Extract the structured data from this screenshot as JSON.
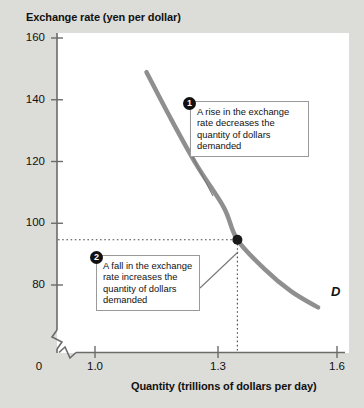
{
  "figure": {
    "background_color": "#dcdcd8",
    "plot_background_color": "#ffffff"
  },
  "chart_data": {
    "type": "line",
    "title": "",
    "xlabel": "Quantity (trillions of dollars per day)",
    "ylabel": "Exchange rate (yen per dollar)",
    "xlim": [
      0.85,
      1.62
    ],
    "ylim": [
      72,
      162
    ],
    "xticks": [
      "0",
      "1.0",
      "1.3",
      "1.6"
    ],
    "xtick_values": [
      0,
      1.0,
      1.3,
      1.6
    ],
    "yticks": [
      "160",
      "140",
      "120",
      "100",
      "80"
    ],
    "ytick_values": [
      160,
      140,
      120,
      100,
      80
    ],
    "grid": false,
    "legend": "none",
    "axis_break_x": true,
    "axis_break_y": true,
    "series": [
      {
        "name": "D",
        "label": "D",
        "color": "#8f8f8f",
        "linewidth": 4.5,
        "points": [
          {
            "x": 1.03,
            "y": 152
          },
          {
            "x": 1.1,
            "y": 138
          },
          {
            "x": 1.18,
            "y": 123
          },
          {
            "x": 1.26,
            "y": 110
          },
          {
            "x": 1.3,
            "y": 100
          },
          {
            "x": 1.38,
            "y": 91
          },
          {
            "x": 1.46,
            "y": 84
          },
          {
            "x": 1.54,
            "y": 79
          }
        ]
      }
    ],
    "markers": [
      {
        "name": "equilibrium-point",
        "x": 1.3,
        "y": 100,
        "color": "#1a1a1a",
        "radius": 5,
        "dropline_x": true,
        "dropline_y": true,
        "dropline_style": "dotted"
      }
    ],
    "annotations": [
      {
        "number": "1",
        "text": "A rise in the exchange rate decreases the quantity of dollars demanded",
        "points_to": {
          "x": 1.22,
          "y": 115
        }
      },
      {
        "number": "2",
        "text": "A fall in the exchange rate increases the quantity of dollars demanded",
        "points_to": {
          "x": 1.38,
          "y": 91
        }
      }
    ]
  },
  "labels": {
    "y_axis_title": "Exchange rate (yen per dollar)",
    "x_axis_title": "Quantity (trillions of dollars per day)",
    "y_160": "160",
    "y_140": "140",
    "y_120": "120",
    "y_100": "100",
    "y_80": "80",
    "x_0": "0",
    "x_10": "1.0",
    "x_13": "1.3",
    "x_16": "1.6",
    "curve": "D",
    "badge_1": "1",
    "badge_2": "2",
    "callout_1": "A rise in the exchange rate decreases the quantity of dollars demanded",
    "callout_2": "A fall in the exchange rate increases the quantity of dollars demanded"
  },
  "colors": {
    "curve": "#8f8f8f",
    "axis": "#6b6b6b",
    "point": "#1a1a1a",
    "text": "#111111"
  }
}
